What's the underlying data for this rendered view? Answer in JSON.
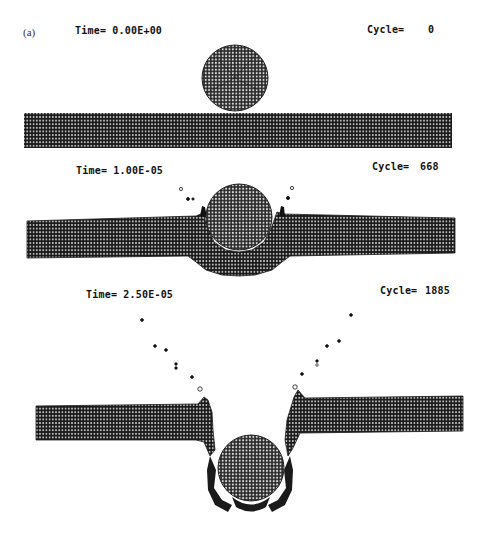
{
  "figure": {
    "panel_label": "(a)",
    "colors": {
      "mesh_dark": "#1a1a1a",
      "mesh_light": "#ffffff",
      "background": "#ffffff",
      "text": "#111111"
    },
    "frames": [
      {
        "time_label": "Time= 0.00E+00",
        "cycle_label": "Cycle=",
        "cycle_value": "0",
        "description": "Sphere resting on top of undeformed plate"
      },
      {
        "time_label": "Time= 1.00E-05",
        "cycle_label": "Cycle=",
        "cycle_value": "668",
        "description": "Sphere penetrating plate, crater forming, debris ejected"
      },
      {
        "time_label": "Time= 2.50E-05",
        "cycle_label": "Cycle=",
        "cycle_value": "1885",
        "description": "Sphere perforated through plate, petals bent downward, debris spray in V pattern"
      }
    ]
  }
}
